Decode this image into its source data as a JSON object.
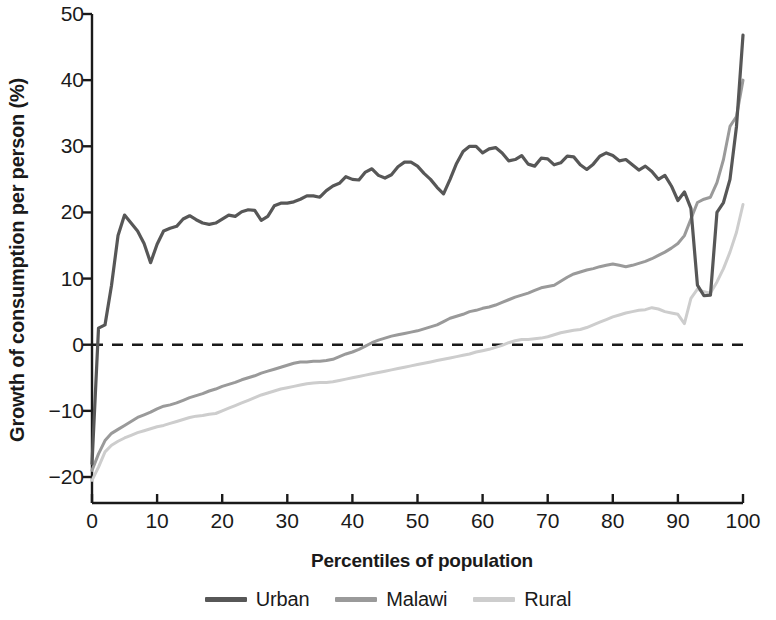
{
  "chart_data": {
    "type": "line",
    "title": "",
    "xlabel": "Percentiles of population",
    "ylabel": "Growth of consumption per person (%)",
    "xlim": [
      0,
      100
    ],
    "ylim": [
      -20,
      50
    ],
    "xticks": [
      0,
      10,
      20,
      30,
      40,
      50,
      60,
      70,
      80,
      90,
      100
    ],
    "yticks": [
      -20,
      -10,
      0,
      10,
      20,
      30,
      40,
      50
    ],
    "grid": false,
    "zero_reference_line": {
      "value": 0,
      "style": "dashed",
      "color": "#1a1a1a"
    },
    "legend_position": "bottom",
    "x": [
      0,
      1,
      2,
      3,
      4,
      5,
      6,
      7,
      8,
      9,
      10,
      11,
      12,
      13,
      14,
      15,
      16,
      17,
      18,
      19,
      20,
      21,
      22,
      23,
      24,
      25,
      26,
      27,
      28,
      29,
      30,
      31,
      32,
      33,
      34,
      35,
      36,
      37,
      38,
      39,
      40,
      41,
      42,
      43,
      44,
      45,
      46,
      47,
      48,
      49,
      50,
      51,
      52,
      53,
      54,
      55,
      56,
      57,
      58,
      59,
      60,
      61,
      62,
      63,
      64,
      65,
      66,
      67,
      68,
      69,
      70,
      71,
      72,
      73,
      74,
      75,
      76,
      77,
      78,
      79,
      80,
      81,
      82,
      83,
      84,
      85,
      86,
      87,
      88,
      89,
      90,
      91,
      92,
      93,
      94,
      95,
      96,
      97,
      98,
      99,
      100
    ],
    "series": [
      {
        "name": "Urban",
        "color": "#575757",
        "width": 3.2,
        "values": [
          -18.0,
          2.5,
          3.0,
          9.0,
          16.5,
          19.6,
          18.4,
          17.2,
          15.3,
          12.4,
          15.2,
          17.2,
          17.6,
          17.9,
          19.0,
          19.5,
          18.9,
          18.4,
          18.2,
          18.4,
          19.0,
          19.6,
          19.4,
          20.1,
          20.4,
          20.3,
          18.8,
          19.4,
          21.0,
          21.4,
          21.4,
          21.6,
          22.0,
          22.5,
          22.5,
          22.3,
          23.3,
          24.0,
          24.4,
          25.4,
          25.0,
          24.9,
          26.1,
          26.6,
          25.6,
          25.2,
          25.7,
          26.9,
          27.6,
          27.6,
          27.0,
          25.9,
          25.0,
          23.8,
          22.8,
          25.0,
          27.4,
          29.2,
          30.0,
          30.0,
          29.0,
          29.6,
          29.8,
          29.0,
          27.8,
          28.0,
          28.6,
          27.3,
          27.0,
          28.2,
          28.1,
          27.2,
          27.5,
          28.5,
          28.4,
          27.2,
          26.5,
          27.3,
          28.5,
          29.0,
          28.6,
          27.8,
          28.0,
          27.2,
          26.4,
          27.0,
          26.2,
          25.0,
          25.6,
          24.0,
          21.8,
          23.1,
          20.6,
          9.0,
          7.4,
          7.5,
          20.0,
          21.5,
          25.0,
          33.0,
          46.8
        ]
      },
      {
        "name": "Malawi",
        "color": "#9a9a9a",
        "width": 3.0,
        "values": [
          -19.0,
          -16.5,
          -14.5,
          -13.4,
          -12.8,
          -12.2,
          -11.6,
          -11.0,
          -10.6,
          -10.2,
          -9.7,
          -9.3,
          -9.1,
          -8.8,
          -8.4,
          -8.0,
          -7.7,
          -7.4,
          -7.0,
          -6.7,
          -6.3,
          -6.0,
          -5.7,
          -5.3,
          -5.0,
          -4.7,
          -4.3,
          -4.0,
          -3.7,
          -3.4,
          -3.1,
          -2.8,
          -2.6,
          -2.6,
          -2.5,
          -2.5,
          -2.4,
          -2.2,
          -1.8,
          -1.4,
          -1.1,
          -0.7,
          -0.2,
          0.3,
          0.7,
          1.0,
          1.3,
          1.5,
          1.7,
          1.9,
          2.1,
          2.4,
          2.7,
          3.0,
          3.5,
          4.0,
          4.3,
          4.6,
          5.0,
          5.2,
          5.5,
          5.7,
          6.0,
          6.4,
          6.8,
          7.2,
          7.5,
          7.8,
          8.2,
          8.6,
          8.8,
          9.0,
          9.6,
          10.2,
          10.7,
          11.0,
          11.3,
          11.5,
          11.8,
          12.0,
          12.2,
          12.0,
          11.8,
          12.0,
          12.3,
          12.6,
          13.0,
          13.5,
          14.0,
          14.6,
          15.3,
          16.5,
          19.0,
          21.5,
          22.0,
          22.3,
          24.5,
          28.0,
          33.0,
          34.5,
          40.0
        ]
      },
      {
        "name": "Rural",
        "color": "#cdcdcd",
        "width": 3.0,
        "values": [
          -20.5,
          -18.5,
          -16.2,
          -15.2,
          -14.6,
          -14.1,
          -13.7,
          -13.3,
          -13.0,
          -12.7,
          -12.4,
          -12.2,
          -11.9,
          -11.6,
          -11.3,
          -11.0,
          -10.8,
          -10.7,
          -10.5,
          -10.4,
          -10.0,
          -9.6,
          -9.2,
          -8.8,
          -8.4,
          -8.0,
          -7.6,
          -7.3,
          -7.0,
          -6.7,
          -6.5,
          -6.3,
          -6.1,
          -5.9,
          -5.8,
          -5.7,
          -5.7,
          -5.6,
          -5.4,
          -5.2,
          -5.0,
          -4.8,
          -4.6,
          -4.4,
          -4.2,
          -4.0,
          -3.8,
          -3.6,
          -3.4,
          -3.2,
          -3.0,
          -2.8,
          -2.6,
          -2.4,
          -2.2,
          -2.0,
          -1.8,
          -1.6,
          -1.4,
          -1.1,
          -0.9,
          -0.7,
          -0.4,
          -0.1,
          0.3,
          0.6,
          0.8,
          0.8,
          0.9,
          1.0,
          1.2,
          1.5,
          1.8,
          2.0,
          2.2,
          2.3,
          2.6,
          3.0,
          3.4,
          3.8,
          4.2,
          4.5,
          4.8,
          5.0,
          5.2,
          5.3,
          5.6,
          5.4,
          5.0,
          4.8,
          4.6,
          3.2,
          7.0,
          8.4,
          8.0,
          7.8,
          9.5,
          11.5,
          14.0,
          17.0,
          21.2
        ]
      }
    ]
  },
  "axis": {
    "y_tick_labels": [
      "50",
      "40",
      "30",
      "20",
      "10",
      "0",
      "−10",
      "−20"
    ],
    "x_tick_labels": [
      "0",
      "10",
      "20",
      "30",
      "40",
      "50",
      "60",
      "70",
      "80",
      "90",
      "100"
    ],
    "y_title": "Growth of consumption per person (%)",
    "x_title": "Percentiles of population"
  },
  "legend": {
    "items": [
      {
        "label": "Urban",
        "color": "#575757"
      },
      {
        "label": "Malawi",
        "color": "#9a9a9a"
      },
      {
        "label": "Rural",
        "color": "#cdcdcd"
      }
    ]
  }
}
